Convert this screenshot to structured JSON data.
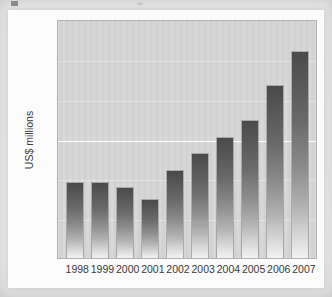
{
  "chart_data": {
    "type": "bar",
    "title": "",
    "subtitle": "",
    "xlabel": "",
    "ylabel": "US$ millions",
    "categories": [
      "1998",
      "1999",
      "2000",
      "2001",
      "2002",
      "2003",
      "2004",
      "2005",
      "2006",
      "2007"
    ],
    "values": [
      3750,
      3750,
      3500,
      2900,
      4370,
      5220,
      6050,
      6880,
      8650,
      10340
    ],
    "series": [
      {
        "name": "US$ millions",
        "values": [
          3750,
          3750,
          3500,
          2900,
          4370,
          5220,
          6050,
          6880,
          8650,
          10340
        ]
      }
    ],
    "ylim": [
      0,
      12000
    ],
    "yticks": [
      0,
      2000,
      4000,
      6000,
      8000,
      10000,
      12000
    ],
    "ytick_labels": [
      "0",
      "2000",
      "4000",
      "6000",
      "8000",
      "10000",
      "12000"
    ],
    "grid": true,
    "gridlines_at": [
      2000,
      4000,
      6000,
      8000,
      10000
    ],
    "legend": [],
    "legend_position": "none",
    "annotations": [],
    "colors": {
      "plot_background": "#d2d2d2",
      "bar_top": "#4a4a4a",
      "bar_bottom": "#f2f2f2",
      "gridline": "#fdfdfd",
      "axis_text": "#3a3a3a",
      "page_background": "#f1f1f1"
    }
  }
}
